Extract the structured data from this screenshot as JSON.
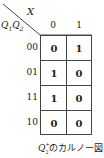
{
  "kmap": {
    "column_variable": "X",
    "row_variable": "Q1Q2",
    "column_headers": [
      "0",
      "1"
    ],
    "row_headers": [
      "00",
      "01",
      "11",
      "10"
    ],
    "cells": [
      [
        "0",
        "1"
      ],
      [
        "1",
        "0"
      ],
      [
        "1",
        "0"
      ],
      [
        "0",
        "0"
      ]
    ]
  },
  "caption": {
    "symbol": "Q",
    "superscript": "+",
    "subscript": "2",
    "text": "のカルノー図"
  }
}
